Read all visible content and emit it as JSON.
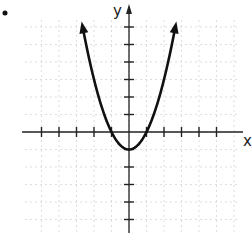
{
  "chart_data": {
    "type": "line",
    "title": "",
    "function": "y = x^2 - 1",
    "xlabel": "x",
    "ylabel": "y",
    "xlim": [
      -6,
      7
    ],
    "ylim": [
      -6,
      7
    ],
    "grid": true,
    "x": [
      -2.65,
      -2,
      -1.5,
      -1,
      -0.5,
      0,
      0.5,
      1,
      1.5,
      2,
      2.65
    ],
    "series": [
      {
        "name": "parabola",
        "values": [
          6.02,
          3,
          1.25,
          0,
          -0.75,
          -1,
          -0.75,
          0,
          1.25,
          3,
          6.02
        ]
      }
    ],
    "vertex": [
      0,
      -1
    ],
    "x_intercepts": [
      -1,
      1
    ],
    "arrows_at_ends": true,
    "colors": {
      "curve": "#111111",
      "axis": "#222222",
      "grid": "#c8c8c8"
    }
  },
  "labels": {
    "x_axis": "x",
    "y_axis": "y"
  }
}
